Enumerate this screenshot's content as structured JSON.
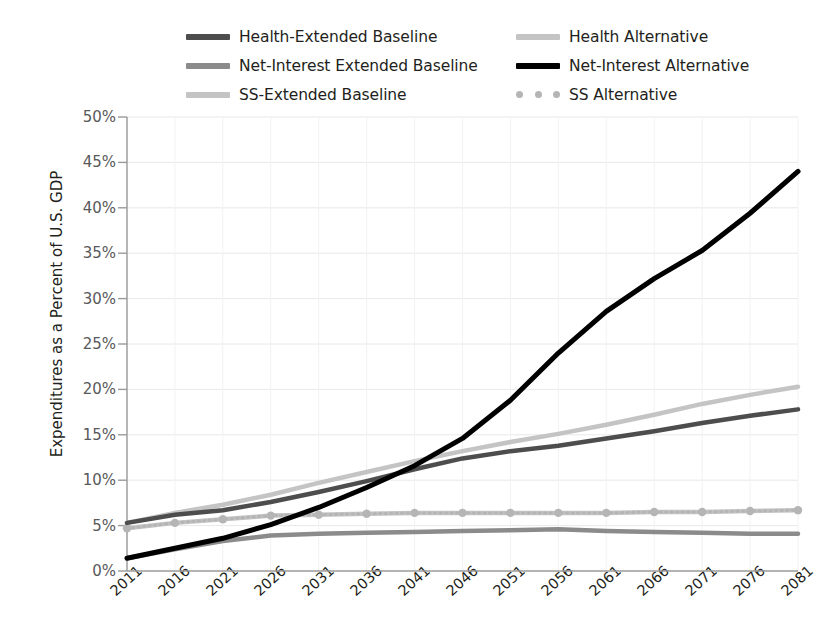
{
  "chart_data": {
    "type": "line",
    "title": "",
    "xlabel": "",
    "ylabel": "Expenditures as a Percent of U.S. GDP",
    "xlim": [
      2011,
      2081
    ],
    "ylim": [
      0,
      50
    ],
    "yticks": [
      "0%",
      "5%",
      "10%",
      "15%",
      "20%",
      "25%",
      "30%",
      "35%",
      "40%",
      "45%",
      "50%"
    ],
    "ytick_values": [
      0,
      5,
      10,
      15,
      20,
      25,
      30,
      35,
      40,
      45,
      50
    ],
    "xticks": [
      "2011",
      "2016",
      "2021",
      "2026",
      "2031",
      "2036",
      "2041",
      "2046",
      "2051",
      "2056",
      "2061",
      "2066",
      "2071",
      "2076",
      "2081"
    ],
    "x": [
      2011,
      2016,
      2021,
      2026,
      2031,
      2036,
      2041,
      2046,
      2051,
      2056,
      2061,
      2066,
      2071,
      2076,
      2081
    ],
    "grid": "horizontal-and-vertical-faint",
    "legend_position": "top",
    "series": [
      {
        "name": "Health-Extended Baseline",
        "color": "#4d4d4d",
        "width": 4.5,
        "style": "solid",
        "markers": false,
        "values": [
          5.3,
          6.2,
          6.7,
          7.6,
          8.7,
          9.9,
          11.2,
          12.4,
          13.2,
          13.8,
          14.6,
          15.4,
          16.3,
          17.1,
          17.8
        ]
      },
      {
        "name": "Health Alternative",
        "color": "#c4c4c4",
        "width": 4.5,
        "style": "solid",
        "markers": false,
        "values": [
          5.3,
          6.4,
          7.3,
          8.4,
          9.7,
          10.9,
          12.1,
          13.2,
          14.2,
          15.1,
          16.1,
          17.2,
          18.4,
          19.4,
          20.3
        ]
      },
      {
        "name": "Net-Interest Extended Baseline",
        "color": "#8b8b8b",
        "width": 4.5,
        "style": "solid",
        "markers": false,
        "values": [
          1.4,
          2.4,
          3.3,
          3.9,
          4.1,
          4.2,
          4.3,
          4.4,
          4.5,
          4.6,
          4.4,
          4.3,
          4.2,
          4.1,
          4.1
        ]
      },
      {
        "name": "Net-Interest Alternative",
        "color": "#000000",
        "width": 5.0,
        "style": "solid",
        "markers": false,
        "values": [
          1.4,
          2.5,
          3.6,
          5.1,
          7.0,
          9.2,
          11.6,
          14.6,
          18.8,
          24.0,
          28.6,
          32.2,
          35.3,
          39.4,
          44.0
        ]
      },
      {
        "name": "SS-Extended Baseline",
        "color": "#c4c4c4",
        "width": 4.5,
        "style": "solid",
        "markers": false,
        "values": [
          4.7,
          5.3,
          5.7,
          6.1,
          6.2,
          6.3,
          6.4,
          6.4,
          6.4,
          6.4,
          6.4,
          6.5,
          6.5,
          6.6,
          6.7
        ]
      },
      {
        "name": "SS Alternative",
        "color": "#b5b5b5",
        "width": 3.0,
        "style": "dotted",
        "markers": true,
        "values": [
          4.7,
          5.3,
          5.7,
          6.1,
          6.2,
          6.3,
          6.4,
          6.4,
          6.4,
          6.4,
          6.4,
          6.5,
          6.5,
          6.6,
          6.7
        ]
      }
    ]
  },
  "legend": {
    "items": [
      {
        "label": "Health-Extended Baseline",
        "color": "#4d4d4d",
        "style": "solid"
      },
      {
        "label": "Health Alternative",
        "color": "#c4c4c4",
        "style": "solid"
      },
      {
        "label": "Net-Interest Extended Baseline",
        "color": "#8b8b8b",
        "style": "solid"
      },
      {
        "label": "Net-Interest Alternative",
        "color": "#000000",
        "style": "solid"
      },
      {
        "label": "SS-Extended Baseline",
        "color": "#c4c4c4",
        "style": "solid"
      },
      {
        "label": "SS Alternative",
        "color": "#b5b5b5",
        "style": "dotted"
      }
    ]
  },
  "axes": {
    "y_title": "Expenditures as a Percent of U.S. GDP"
  }
}
